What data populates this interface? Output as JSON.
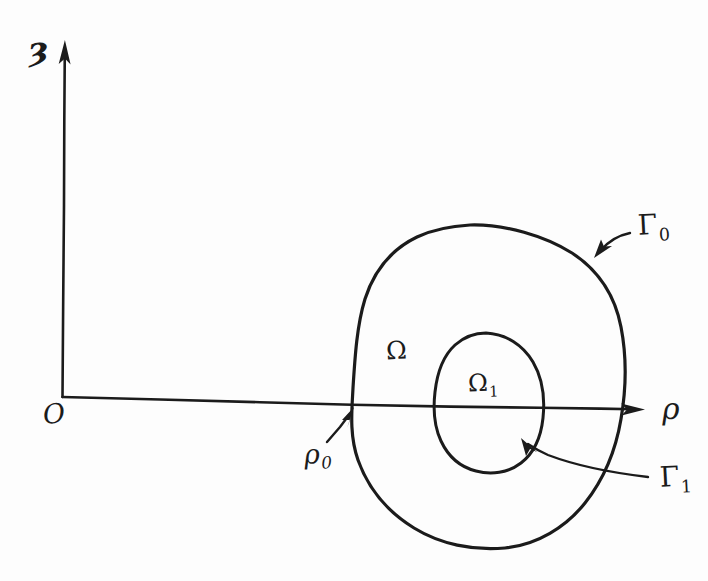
{
  "figure": {
    "kind": "hand-drawn-sketch",
    "ink_color": "#1b1b1b",
    "background_color": "#fdfdfd",
    "width": 708,
    "height": 581
  },
  "axes": {
    "vertical": {
      "label": "ȝ",
      "name": "z-axis",
      "direction": "up",
      "arrow": true
    },
    "horizontal": {
      "label": "ρ",
      "name": "rho-axis",
      "direction": "right",
      "arrow": true
    },
    "origin_label": "O"
  },
  "regions": [
    {
      "id": "omega",
      "label": "Ω",
      "description": "outer region between the two closed curves"
    },
    {
      "id": "omega-1",
      "label": "Ω",
      "subscript": "1",
      "description": "inner region enclosed by the small closed curve"
    }
  ],
  "boundaries": [
    {
      "id": "gamma-0",
      "label": "Γ",
      "subscript": "0",
      "description": "outer closed boundary curve",
      "leader": "curved arrow pointing down-left to the outer curve"
    },
    {
      "id": "gamma-1",
      "label": "Γ",
      "subscript": "1",
      "description": "inner closed boundary curve",
      "leader": "curved arrow pointing up-left to the inner curve"
    }
  ],
  "points": [
    {
      "id": "rho-0",
      "label": "ρ",
      "subscript": "0",
      "description": "intersection of the outer curve with the rho axis",
      "leader": "straight arrow pointing up-right to the crossing point"
    }
  ]
}
